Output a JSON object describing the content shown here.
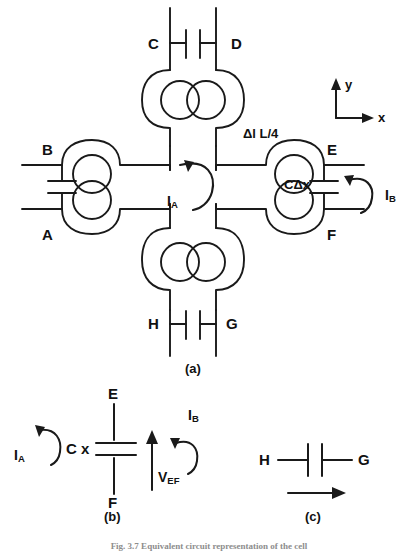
{
  "figure": {
    "panels": [
      {
        "id": "a",
        "label": "(a)"
      },
      {
        "id": "b",
        "label": "(b)"
      },
      {
        "id": "c",
        "label": "(c)"
      }
    ],
    "caption": "Fig. 3.7  Equivalent circuit representation of the cell"
  },
  "panel_a": {
    "nodes": {
      "A": "A",
      "B": "B",
      "C": "C",
      "D": "D",
      "E": "E",
      "F": "F",
      "G": "G",
      "H": "H"
    },
    "annotations": {
      "delta_l": "Δl L/4",
      "c_delta_x": "CΔx",
      "current_a": "I",
      "current_a_sub": "A",
      "current_b": "I",
      "current_b_sub": "B"
    },
    "axes": {
      "x_label": "x",
      "y_label": "y"
    },
    "panel_label": "(a)"
  },
  "panel_b": {
    "node_top": "E",
    "node_bottom": "F",
    "cap_label": "C  x",
    "voltage": "V",
    "voltage_sub": "EF",
    "current_a": "I",
    "current_a_sub": "A",
    "current_b": "I",
    "current_b_sub": "B",
    "panel_label": "(b)"
  },
  "panel_c": {
    "node_left": "H",
    "node_right": "G",
    "panel_label": "(c)"
  },
  "style": {
    "stroke": "#1a1a1a",
    "background": "#ffffff"
  }
}
